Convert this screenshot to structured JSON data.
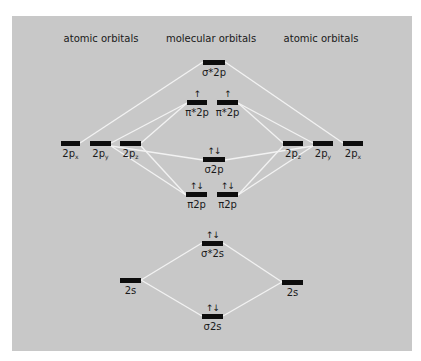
{
  "diagram": {
    "type": "molecular-orbital-energy-diagram",
    "headings": {
      "left": "atomic orbitals",
      "center": "molecular orbitals",
      "right": "atomic orbitals"
    },
    "colors": {
      "background": "#c8c8c8",
      "bar": "#0d0d0d",
      "line": "#f2f2f2",
      "text": "#1a1a1a"
    },
    "atomic_orbitals_left": [
      {
        "id": "L-2px",
        "label": "2p",
        "sub": "x",
        "x": 61,
        "w": 19,
        "y": 141
      },
      {
        "id": "L-2py",
        "label": "2p",
        "sub": "y",
        "x": 90,
        "w": 21,
        "y": 141
      },
      {
        "id": "L-2pz",
        "label": "2p",
        "sub": "z",
        "x": 120,
        "w": 21,
        "y": 141
      },
      {
        "id": "L-2s",
        "label": "2s",
        "sub": "",
        "x": 120,
        "w": 21,
        "y": 278
      }
    ],
    "atomic_orbitals_right": [
      {
        "id": "R-2pz",
        "label": "2p",
        "sub": "z",
        "x": 283,
        "w": 20,
        "y": 141
      },
      {
        "id": "R-2py",
        "label": "2p",
        "sub": "y",
        "x": 313,
        "w": 20,
        "y": 141
      },
      {
        "id": "R-2px",
        "label": "2p",
        "sub": "x",
        "x": 343,
        "w": 20,
        "y": 141
      },
      {
        "id": "R-2s",
        "label": "2s",
        "sub": "",
        "x": 282,
        "w": 21,
        "y": 280
      }
    ],
    "molecular_orbitals": [
      {
        "id": "sigma-star-2p",
        "label": "σ*2p",
        "electrons": "",
        "x": 203,
        "w": 22,
        "y": 60
      },
      {
        "id": "pi-star-2p-a",
        "label": "π*2p",
        "electrons": "↑",
        "x": 187,
        "w": 20,
        "y": 100
      },
      {
        "id": "pi-star-2p-b",
        "label": "π*2p",
        "electrons": "↑",
        "x": 217,
        "w": 21,
        "y": 100
      },
      {
        "id": "sigma-2p",
        "label": "σ2p",
        "electrons": "↑↓",
        "x": 203,
        "w": 22,
        "y": 157
      },
      {
        "id": "pi-2p-a",
        "label": "π2p",
        "electrons": "↑↓",
        "x": 186,
        "w": 21,
        "y": 192
      },
      {
        "id": "pi-2p-b",
        "label": "π2p",
        "electrons": "↑↓",
        "x": 217,
        "w": 21,
        "y": 192
      },
      {
        "id": "sigma-star-2s",
        "label": "σ*2s",
        "electrons": "↑↓",
        "x": 202,
        "w": 21,
        "y": 241
      },
      {
        "id": "sigma-2s",
        "label": "σ2s",
        "electrons": "↑↓",
        "x": 202,
        "w": 21,
        "y": 314
      }
    ],
    "connections": [
      {
        "from": "L-2px",
        "to": "sigma-star-2p",
        "x1": 80,
        "y1": 143,
        "x2": 203,
        "y2": 62
      },
      {
        "from": "R-2px",
        "to": "sigma-star-2p",
        "x1": 343,
        "y1": 143,
        "x2": 225,
        "y2": 62
      },
      {
        "from": "L-2py",
        "to": "pi-star-2p-a",
        "x1": 111,
        "y1": 143,
        "x2": 187,
        "y2": 103
      },
      {
        "from": "L-2pz",
        "to": "pi-star-2p-a",
        "x1": 141,
        "y1": 143,
        "x2": 187,
        "y2": 103
      },
      {
        "from": "R-2pz",
        "to": "pi-star-2p-b",
        "x1": 283,
        "y1": 143,
        "x2": 238,
        "y2": 103
      },
      {
        "from": "R-2py",
        "to": "pi-star-2p-b",
        "x1": 313,
        "y1": 143,
        "x2": 238,
        "y2": 103
      },
      {
        "from": "L-2py",
        "to": "sigma-2p",
        "x1": 111,
        "y1": 146,
        "x2": 203,
        "y2": 160
      },
      {
        "from": "R-2py",
        "to": "sigma-2p",
        "x1": 313,
        "y1": 146,
        "x2": 225,
        "y2": 160
      },
      {
        "from": "L-2py",
        "to": "pi-2p-a",
        "x1": 111,
        "y1": 146,
        "x2": 186,
        "y2": 195
      },
      {
        "from": "L-2pz",
        "to": "pi-2p-a",
        "x1": 141,
        "y1": 146,
        "x2": 186,
        "y2": 195
      },
      {
        "from": "R-2pz",
        "to": "pi-2p-b",
        "x1": 283,
        "y1": 146,
        "x2": 238,
        "y2": 195
      },
      {
        "from": "R-2py",
        "to": "pi-2p-b",
        "x1": 313,
        "y1": 146,
        "x2": 238,
        "y2": 195
      },
      {
        "from": "L-2s",
        "to": "sigma-star-2s",
        "x1": 141,
        "y1": 280,
        "x2": 202,
        "y2": 243
      },
      {
        "from": "R-2s",
        "to": "sigma-star-2s",
        "x1": 282,
        "y1": 282,
        "x2": 223,
        "y2": 243
      },
      {
        "from": "L-2s",
        "to": "sigma-2s",
        "x1": 141,
        "y1": 280,
        "x2": 202,
        "y2": 316
      },
      {
        "from": "R-2s",
        "to": "sigma-2s",
        "x1": 282,
        "y1": 282,
        "x2": 223,
        "y2": 316
      }
    ]
  }
}
